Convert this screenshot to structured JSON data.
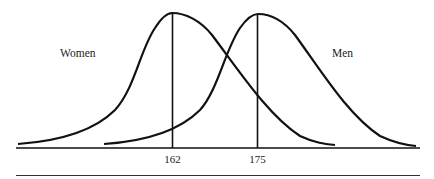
{
  "diagram": {
    "type": "overlapping-normal-distributions",
    "curves": [
      {
        "name": "Women",
        "mean_label": "162",
        "label": "Women"
      },
      {
        "name": "Men",
        "mean_label": "175",
        "label": "Men"
      }
    ],
    "tick_labels": [
      "162",
      "175"
    ]
  }
}
